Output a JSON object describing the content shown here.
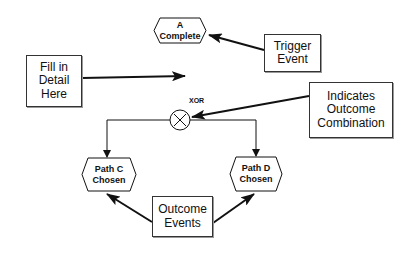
{
  "diagram": {
    "events": {
      "a_complete": {
        "lines": [
          "A",
          "Complete"
        ]
      },
      "path_c": {
        "lines": [
          "Path C",
          "Chosen"
        ]
      },
      "path_d": {
        "lines": [
          "Path D",
          "Chosen"
        ]
      }
    },
    "operator": {
      "label": "XOR",
      "symbol": "×"
    },
    "annotations": {
      "fill_in": {
        "lines": [
          "Fill in",
          "Detail",
          "Here"
        ]
      },
      "trigger": {
        "lines": [
          "Trigger",
          "Event"
        ]
      },
      "indicates": {
        "lines": [
          "Indicates",
          "Outcome",
          "Combination"
        ]
      },
      "outcome": {
        "lines": [
          "Outcome",
          "Events"
        ]
      }
    },
    "colors": {
      "stroke": "#111111",
      "background": "#ffffff"
    }
  }
}
